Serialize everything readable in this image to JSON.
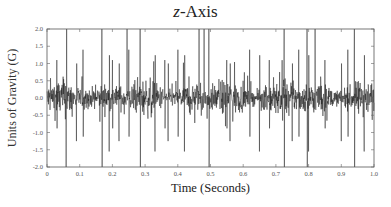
{
  "chart_data": {
    "type": "line",
    "title": "z-Axis",
    "title_parts": {
      "var": "z",
      "rest": "-Axis"
    },
    "xlabel": "Time (Seconds)",
    "ylabel": "Units of Gravity (G)",
    "xlim": [
      0,
      1.0
    ],
    "ylim": [
      -2.0,
      2.0
    ],
    "x_ticks": [
      0,
      0.1,
      0.2,
      0.3,
      0.4,
      0.5,
      0.6,
      0.7,
      0.8,
      0.9,
      1.0
    ],
    "x_tick_labels": [
      "0",
      "0.1",
      "0.2",
      "0.3",
      "0.4",
      "0.5",
      "0.6",
      "0.7",
      "0.8",
      "0.9",
      "1.0"
    ],
    "y_ticks": [
      2.0,
      1.5,
      1.0,
      0.5,
      0.0,
      -0.5,
      -1.0,
      -1.5,
      -2.0
    ],
    "y_tick_labels": [
      "2.0",
      "1.5",
      "1.0",
      "0.5",
      "0.0",
      "-0.5",
      "-1.0",
      "-1.5",
      "-2.0"
    ],
    "grid": false,
    "legend": null,
    "series": [
      {
        "name": "z-axis acceleration",
        "color": "#111111",
        "description": "Dense noisy vibration signal centered near 0 G, typical amplitude about ±0.5 G with frequent excursions to ±1.0–1.5 G and saturating spikes reaching ±2.0 G",
        "baseline_amplitude": 0.45,
        "saturating_spikes_top_t": [
          0.06,
          0.168,
          0.245,
          0.285,
          0.465,
          0.48,
          0.495,
          0.725,
          0.795,
          0.82,
          0.94
        ],
        "saturating_spikes_bottom_t": [
          0.058,
          0.168,
          0.285,
          0.495,
          0.725,
          0.795,
          0.94
        ],
        "large_spikes_t": [
          0.03,
          0.09,
          0.11,
          0.19,
          0.2,
          0.22,
          0.25,
          0.33,
          0.36,
          0.37,
          0.4,
          0.42,
          0.55,
          0.56,
          0.62,
          0.65,
          0.68,
          0.75,
          0.77,
          0.8,
          0.85,
          0.9,
          0.92,
          0.97
        ],
        "samples": 1300
      }
    ]
  },
  "layout": {
    "plot_left": 47,
    "plot_top": 29,
    "plot_right": 374,
    "plot_bottom": 167
  }
}
